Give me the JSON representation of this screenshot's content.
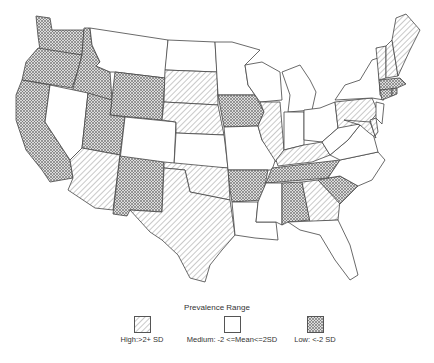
{
  "legend": {
    "title": "Prevalence Range",
    "items": [
      {
        "key": "high",
        "label": "High:>2+ SD",
        "pattern": "diagonal-hatch"
      },
      {
        "key": "medium",
        "label": "Medium: -2 <=Mean<=2SD",
        "pattern": "blank"
      },
      {
        "key": "low",
        "label": "Low: <-2 SD",
        "pattern": "crosshatch"
      }
    ]
  },
  "states": {
    "WA": "low",
    "OR": "low",
    "CA": "low",
    "ID": "low",
    "NV": "medium",
    "MT": "medium",
    "WY": "low",
    "UT": "low",
    "AZ": "high",
    "CO": "medium",
    "NM": "low",
    "ND": "medium",
    "SD": "high",
    "NE": "high",
    "KS": "medium",
    "OK": "high",
    "TX": "high",
    "MN": "medium",
    "IA": "low",
    "MO": "medium",
    "AR": "low",
    "LA": "medium",
    "WI": "medium",
    "IL": "high",
    "MI": "medium",
    "IN": "medium",
    "OH": "medium",
    "KY": "high",
    "TN": "low",
    "MS": "medium",
    "AL": "low",
    "GA": "high",
    "FL": "medium",
    "SC": "low",
    "NC": "medium",
    "VA": "medium",
    "WV": "medium",
    "PA": "high",
    "NY": "medium",
    "MD": "high",
    "DE": "high",
    "NJ": "medium",
    "CT": "low",
    "RI": "low",
    "MA": "low",
    "VT": "high",
    "NH": "high",
    "ME": "high"
  }
}
